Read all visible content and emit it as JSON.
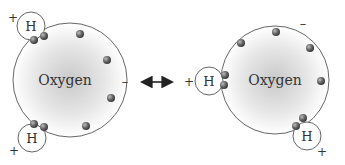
{
  "diagram": {
    "left_molecule": {
      "center_label": "Oxygen",
      "hydrogen_top_label": "H",
      "hydrogen_bottom_label": "H",
      "charge_h_top": "+",
      "charge_h_bottom": "+",
      "charge_oxygen": "–"
    },
    "right_molecule": {
      "center_label": "Oxygen",
      "hydrogen_left_label": "H",
      "hydrogen_bottom_label": "H",
      "charge_h_left": "+",
      "charge_h_bottom": "+",
      "charge_oxygen": "–"
    },
    "arrow": "double-headed-arrow"
  },
  "colors": {
    "oxygen_center": "#d8d8d8",
    "oxygen_edge": "#ffffff",
    "outline": "#666666",
    "electron": "#555555"
  }
}
